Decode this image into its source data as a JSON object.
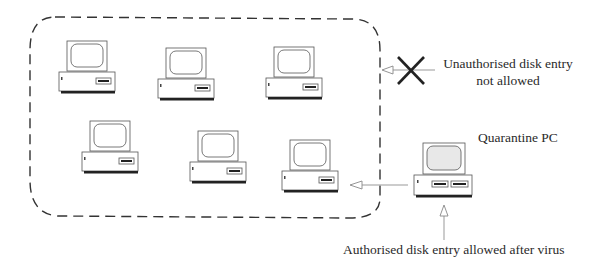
{
  "diagram": {
    "network_boundary": {
      "style": "dashed rounded rectangle",
      "contains_pc_count": 6
    },
    "network_pcs": [
      {
        "id": "pc-1",
        "x": 59,
        "y": 41,
        "w": 57
      },
      {
        "id": "pc-2",
        "x": 158,
        "y": 48,
        "w": 58
      },
      {
        "id": "pc-3",
        "x": 266,
        "y": 47,
        "w": 56
      },
      {
        "id": "pc-4",
        "x": 82,
        "y": 121,
        "w": 57
      },
      {
        "id": "pc-5",
        "x": 190,
        "y": 130,
        "w": 58
      },
      {
        "id": "pc-6",
        "x": 282,
        "y": 140,
        "w": 56
      }
    ],
    "quarantine_pc": {
      "label": "Quarantine PC",
      "drive_slots": 2,
      "screen_color": "#e8e8e8"
    },
    "blocked_entry": {
      "label_line1": "Unauthorised disk entry",
      "label_line2": "not allowed",
      "marker": "x-icon"
    },
    "authorised_entry": {
      "label": "Authorised disk entry allowed after virus"
    },
    "colors": {
      "line": "#333333",
      "arrow": "#999999",
      "boundary": "#333333"
    }
  }
}
